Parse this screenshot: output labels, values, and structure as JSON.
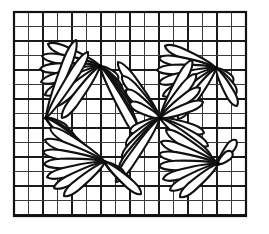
{
  "figure": {
    "background_color": "#ffffff",
    "ink_color": "#000000",
    "petal_fill_color": "#ffffff",
    "petal_stroke_color": "#111111"
  },
  "canvas": {
    "width": 269,
    "height": 234
  },
  "grid": {
    "name": "graph-paper-grid",
    "x_start": 14,
    "y_start": 12,
    "x_end": 246,
    "y_end": 216,
    "cell_size": 14.5,
    "columns": 16,
    "rows": 14,
    "minor_color": "#3a3a3a",
    "minor_width": 1.1,
    "major_color": "#1a1a1a",
    "major_width": 1.9,
    "major_every": 2,
    "border_color": "#111111",
    "border_width": 2.2
  },
  "pattern": {
    "type": "radiating-petal-fans",
    "petal_count_total": 60,
    "node_count": 6,
    "nodes": [
      {
        "id": "node-top-left",
        "x": 100,
        "y": 66,
        "label": "upper left convergence"
      },
      {
        "id": "node-top-right",
        "x": 216,
        "y": 68,
        "label": "upper right convergence"
      },
      {
        "id": "node-mid-left",
        "x": 46,
        "y": 118,
        "label": "middle left convergence"
      },
      {
        "id": "node-mid-right",
        "x": 160,
        "y": 118,
        "label": "middle right convergence"
      },
      {
        "id": "node-bottom-left",
        "x": 105,
        "y": 162,
        "label": "lower left convergence"
      },
      {
        "id": "node-bottom-right",
        "x": 218,
        "y": 164,
        "label": "lower right convergence"
      }
    ],
    "fans": [
      {
        "id": "fan-tl-down-left",
        "node": "node-top-left",
        "direction": "left-down",
        "petals": [
          {
            "tip_x": 48,
            "tip_y": 44,
            "len": 54,
            "width": 9.5
          },
          {
            "tip_x": 42,
            "tip_y": 56,
            "len": 59,
            "width": 9.5
          },
          {
            "tip_x": 40,
            "tip_y": 69,
            "len": 60,
            "width": 9.5
          },
          {
            "tip_x": 41,
            "tip_y": 82,
            "len": 60,
            "width": 9.5
          },
          {
            "tip_x": 45,
            "tip_y": 95,
            "len": 60,
            "width": 9.5
          },
          {
            "tip_x": 52,
            "tip_y": 107,
            "len": 60,
            "width": 9.5
          },
          {
            "tip_x": 62,
            "tip_y": 118,
            "len": 62,
            "width": 9.5
          }
        ]
      },
      {
        "id": "fan-tl-down-right",
        "node": "node-top-left",
        "direction": "right-down",
        "petals": [
          {
            "tip_x": 118,
            "tip_y": 80,
            "len": 24,
            "width": 8.5
          },
          {
            "tip_x": 122,
            "tip_y": 92,
            "len": 34,
            "width": 9.0
          },
          {
            "tip_x": 128,
            "tip_y": 104,
            "len": 45,
            "width": 9.0
          },
          {
            "tip_x": 133,
            "tip_y": 116,
            "len": 56,
            "width": 9.0
          },
          {
            "tip_x": 137,
            "tip_y": 128,
            "len": 66,
            "width": 9.0
          },
          {
            "tip_x": 141,
            "tip_y": 140,
            "len": 77,
            "width": 9.0
          }
        ]
      },
      {
        "id": "fan-tr-left-down",
        "node": "node-top-right",
        "direction": "left-down",
        "petals": [
          {
            "tip_x": 165,
            "tip_y": 46,
            "len": 55,
            "width": 9.5
          },
          {
            "tip_x": 159,
            "tip_y": 58,
            "len": 59,
            "width": 9.5
          },
          {
            "tip_x": 157,
            "tip_y": 70,
            "len": 59,
            "width": 9.5
          },
          {
            "tip_x": 159,
            "tip_y": 83,
            "len": 59,
            "width": 9.5
          },
          {
            "tip_x": 163,
            "tip_y": 96,
            "len": 59,
            "width": 9.5
          },
          {
            "tip_x": 170,
            "tip_y": 108,
            "len": 59,
            "width": 9.5
          },
          {
            "tip_x": 178,
            "tip_y": 119,
            "len": 60,
            "width": 9.5
          }
        ]
      },
      {
        "id": "fan-tr-right-down",
        "node": "node-top-right",
        "direction": "right-down",
        "petals": [
          {
            "tip_x": 233,
            "tip_y": 82,
            "len": 22,
            "width": 8.5
          },
          {
            "tip_x": 236,
            "tip_y": 94,
            "len": 32,
            "width": 9.0
          },
          {
            "tip_x": 237,
            "tip_y": 106,
            "len": 43,
            "width": 9.0
          }
        ]
      },
      {
        "id": "fan-ml-right-up",
        "node": "node-mid-left",
        "direction": "right-up",
        "petals": [
          {
            "tip_x": 76,
            "tip_y": 40,
            "len": 82,
            "width": 9.5
          },
          {
            "tip_x": 88,
            "tip_y": 52,
            "len": 78,
            "width": 9.5
          }
        ]
      },
      {
        "id": "fan-ml-right-down",
        "node": "node-mid-left",
        "direction": "right-down",
        "petals": [
          {
            "tip_x": 68,
            "tip_y": 131,
            "len": 24,
            "width": 9.0
          },
          {
            "tip_x": 76,
            "tip_y": 141,
            "len": 37,
            "width": 9.5
          },
          {
            "tip_x": 84,
            "tip_y": 150,
            "len": 50,
            "width": 9.5
          },
          {
            "tip_x": 93,
            "tip_y": 158,
            "len": 62,
            "width": 9.5
          }
        ]
      },
      {
        "id": "fan-mr-left-up",
        "node": "node-mid-right",
        "direction": "left-up",
        "petals": [
          {
            "tip_x": 118,
            "tip_y": 62,
            "len": 70,
            "width": 9.5
          },
          {
            "tip_x": 122,
            "tip_y": 76,
            "len": 57,
            "width": 9.5
          },
          {
            "tip_x": 126,
            "tip_y": 90,
            "len": 45,
            "width": 9.5
          },
          {
            "tip_x": 130,
            "tip_y": 103,
            "len": 35,
            "width": 9.0
          }
        ]
      },
      {
        "id": "fan-mr-left-down",
        "node": "node-mid-right",
        "direction": "left-down",
        "petals": [
          {
            "tip_x": 130,
            "tip_y": 132,
            "len": 33,
            "width": 9.0
          },
          {
            "tip_x": 126,
            "tip_y": 145,
            "len": 44,
            "width": 9.5
          },
          {
            "tip_x": 122,
            "tip_y": 158,
            "len": 56,
            "width": 9.5
          },
          {
            "tip_x": 119,
            "tip_y": 170,
            "len": 67,
            "width": 9.5
          },
          {
            "tip_x": 116,
            "tip_y": 182,
            "len": 78,
            "width": 9.5
          }
        ]
      },
      {
        "id": "fan-mr-right-up",
        "node": "node-mid-right",
        "direction": "right-up",
        "petals": [
          {
            "tip_x": 192,
            "tip_y": 60,
            "len": 70,
            "width": 9.5
          },
          {
            "tip_x": 196,
            "tip_y": 74,
            "len": 57,
            "width": 9.5
          },
          {
            "tip_x": 200,
            "tip_y": 88,
            "len": 45,
            "width": 9.5
          },
          {
            "tip_x": 203,
            "tip_y": 102,
            "len": 34,
            "width": 9.0
          }
        ]
      },
      {
        "id": "fan-mr-right-down",
        "node": "node-mid-right",
        "direction": "right-down",
        "petals": [
          {
            "tip_x": 204,
            "tip_y": 133,
            "len": 33,
            "width": 9.0
          },
          {
            "tip_x": 208,
            "tip_y": 146,
            "len": 45,
            "width": 9.5
          },
          {
            "tip_x": 212,
            "tip_y": 159,
            "len": 57,
            "width": 9.5
          }
        ]
      },
      {
        "id": "fan-bl-left-up",
        "node": "node-bottom-left",
        "direction": "left-up",
        "petals": [
          {
            "tip_x": 50,
            "tip_y": 128,
            "len": 65,
            "width": 9.5
          },
          {
            "tip_x": 45,
            "tip_y": 140,
            "len": 63,
            "width": 9.5
          },
          {
            "tip_x": 43,
            "tip_y": 152,
            "len": 62,
            "width": 9.5
          }
        ]
      },
      {
        "id": "fan-bl-left-down",
        "node": "node-bottom-left",
        "direction": "left-down",
        "petals": [
          {
            "tip_x": 44,
            "tip_y": 164,
            "len": 61,
            "width": 9.5
          },
          {
            "tip_x": 47,
            "tip_y": 177,
            "len": 61,
            "width": 9.5
          },
          {
            "tip_x": 54,
            "tip_y": 188,
            "len": 58,
            "width": 9.5
          },
          {
            "tip_x": 64,
            "tip_y": 196,
            "len": 55,
            "width": 9.5
          }
        ]
      },
      {
        "id": "fan-bl-right-down",
        "node": "node-bottom-left",
        "direction": "right-down",
        "petals": [
          {
            "tip_x": 124,
            "tip_y": 176,
            "len": 23,
            "width": 8.5
          },
          {
            "tip_x": 133,
            "tip_y": 186,
            "len": 36,
            "width": 9.0
          },
          {
            "tip_x": 141,
            "tip_y": 194,
            "len": 48,
            "width": 9.0
          }
        ]
      },
      {
        "id": "fan-br-left-up",
        "node": "node-bottom-right",
        "direction": "left-up",
        "petals": [
          {
            "tip_x": 166,
            "tip_y": 130,
            "len": 63,
            "width": 9.5
          },
          {
            "tip_x": 161,
            "tip_y": 142,
            "len": 62,
            "width": 9.5
          },
          {
            "tip_x": 159,
            "tip_y": 154,
            "len": 61,
            "width": 9.5
          }
        ]
      },
      {
        "id": "fan-br-left-down",
        "node": "node-bottom-right",
        "direction": "left-down",
        "petals": [
          {
            "tip_x": 159,
            "tip_y": 166,
            "len": 60,
            "width": 9.5
          },
          {
            "tip_x": 163,
            "tip_y": 179,
            "len": 60,
            "width": 9.5
          },
          {
            "tip_x": 170,
            "tip_y": 190,
            "len": 57,
            "width": 9.5
          },
          {
            "tip_x": 180,
            "tip_y": 197,
            "len": 52,
            "width": 9.5
          }
        ]
      },
      {
        "id": "fan-br-right-up",
        "node": "node-bottom-right",
        "direction": "right-up",
        "petals": [
          {
            "tip_x": 236,
            "tip_y": 140,
            "len": 28,
            "width": 9.0
          },
          {
            "tip_x": 232,
            "tip_y": 152,
            "len": 19,
            "width": 8.5
          }
        ]
      }
    ]
  }
}
